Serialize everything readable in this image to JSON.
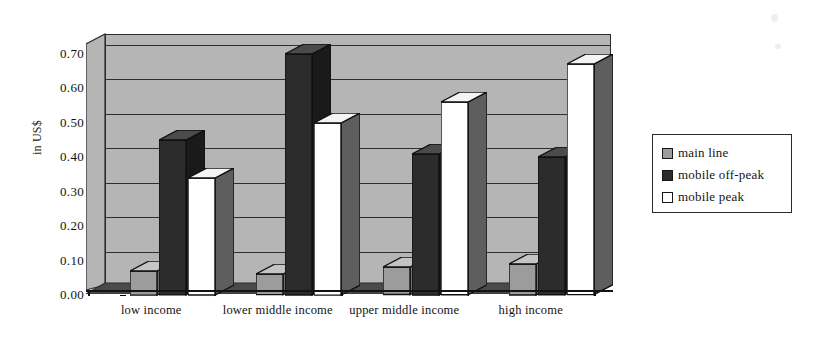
{
  "chart_data": {
    "type": "bar",
    "title": "",
    "subtitle": "",
    "xlabel": "",
    "ylabel": "in US$",
    "categories": [
      "low income",
      "lower middle income",
      "upper middle income",
      "high income"
    ],
    "series": [
      {
        "name": "main line",
        "color": "#9c9c9c",
        "values": [
          0.07,
          0.06,
          0.08,
          0.09
        ]
      },
      {
        "name": "mobile off-peak",
        "color": "#2c2c2c",
        "values": [
          0.45,
          0.7,
          0.41,
          0.4
        ]
      },
      {
        "name": "mobile peak",
        "color": "#ffffff",
        "values": [
          0.34,
          0.5,
          0.56,
          0.67
        ]
      }
    ],
    "ylim": [
      0.0,
      0.7
    ],
    "ytick_labels": [
      "0.70",
      "0.60",
      "0.50",
      "0.40",
      "0.30",
      "0.20",
      "0.10",
      "0.00"
    ],
    "ytick_values": [
      0.7,
      0.6,
      0.5,
      0.4,
      0.3,
      0.2,
      0.1,
      0.0
    ],
    "grid": true,
    "three_d": true,
    "legend_position": "right"
  },
  "axes": {
    "y_title": "in US$"
  },
  "legend": {
    "items": [
      {
        "label": "main line",
        "swatch": "#9c9c9c"
      },
      {
        "label": "mobile off-peak",
        "swatch": "#2c2c2c"
      },
      {
        "label": "mobile peak",
        "swatch": "#ffffff"
      }
    ]
  },
  "colors": {
    "plot_background": "#b5b5b5",
    "axis": "#121212",
    "gridline": "#2f2f2f",
    "series_main_line": "#9c9c9c",
    "series_mobile_off_peak": "#2c2c2c",
    "series_mobile_peak": "#ffffff"
  }
}
